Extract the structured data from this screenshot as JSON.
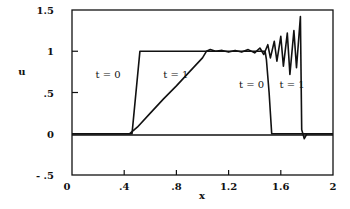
{
  "chart_data": {
    "type": "line",
    "title": "",
    "xlabel": "x",
    "ylabel": "u",
    "xlim": [
      0,
      2
    ],
    "ylim": [
      -0.5,
      1.5
    ],
    "grid": false,
    "legend": "none (inline annotations)",
    "x_ticks": [
      {
        "value": 0,
        "label": "0"
      },
      {
        "value": 0.4,
        "label": ".4"
      },
      {
        "value": 0.8,
        "label": ".8"
      },
      {
        "value": 1.2,
        "label": "1.2"
      },
      {
        "value": 1.6,
        "label": "1.6"
      },
      {
        "value": 2,
        "label": "2"
      }
    ],
    "y_ticks": [
      {
        "value": -0.5,
        "label": "- .5"
      },
      {
        "value": 0,
        "label": "0"
      },
      {
        "value": 0.5,
        "label": ".5"
      },
      {
        "value": 1,
        "label": "1"
      },
      {
        "value": 1.5,
        "label": "1.5"
      }
    ],
    "series": [
      {
        "name": "t = 0",
        "x": [
          0,
          0.46,
          0.52,
          1.48,
          1.49,
          1.51,
          1.53,
          2.0
        ],
        "y": [
          0,
          0,
          1.0,
          1.0,
          0.9,
          0.5,
          0.0,
          0.0
        ]
      },
      {
        "name": "t = 1",
        "x": [
          0,
          0.44,
          0.5,
          0.6,
          0.7,
          0.8,
          0.9,
          1.0,
          1.03,
          1.06,
          1.1,
          1.15,
          1.2,
          1.25,
          1.3,
          1.35,
          1.4,
          1.44,
          1.47,
          1.5,
          1.52,
          1.55,
          1.57,
          1.6,
          1.62,
          1.65,
          1.67,
          1.7,
          1.72,
          1.75,
          1.76,
          1.78,
          1.8,
          2.0
        ],
        "y": [
          0,
          0,
          0.08,
          0.25,
          0.42,
          0.58,
          0.75,
          0.92,
          1.0,
          1.02,
          1.0,
          1.01,
          0.99,
          1.01,
          0.99,
          1.02,
          0.98,
          1.04,
          0.96,
          1.08,
          0.92,
          1.12,
          0.88,
          1.18,
          0.82,
          1.22,
          0.72,
          1.25,
          0.8,
          1.42,
          0.05,
          -0.06,
          0.0,
          0.0
        ]
      }
    ],
    "annotations": [
      {
        "text": "t = 0",
        "x": 0.18,
        "y": 0.67
      },
      {
        "text": "t = 1",
        "x": 0.7,
        "y": 0.67
      },
      {
        "text": "t = 0",
        "x": 1.28,
        "y": 0.55
      },
      {
        "text": "t = 1",
        "x": 1.59,
        "y": 0.55
      }
    ]
  }
}
